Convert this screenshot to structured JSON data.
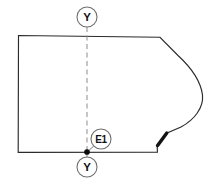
{
  "drawing": {
    "title": "Cross-section outline with section plane Y-Y and detail callout E1",
    "canvas": {
      "width": 214,
      "height": 184,
      "background": "#ffffff"
    },
    "style": {
      "outline_color": "#2b2b2b",
      "outline_width": 1.15,
      "highlight_color": "#131313",
      "highlight_width": 3.4,
      "centerline_color": "#8d8d8d",
      "marker_stroke_color": "#6e6e6e",
      "marker_fill_color": "#ffffff",
      "text_color": "#111111",
      "dot_color": "#0d0d0d"
    },
    "outline": {
      "name": "part-profile",
      "closed": true,
      "path": "M 18.5 35.5 L 160.0 37.3 L 178.0 55.5 C 190.0 66.5 200.5 80.0 202.5 95.0 C 203.8 108.0 194.0 120.0 181.0 127.0 L 166.5 133.2 L 157.2 146.0 L 157.4 152.2 L 18.2 152.4 Z",
      "description": "Left vertical edge slightly tapered, flat top edge, chamfer down-right, convex bulge on the right, concave return and a small step notch at lower right, flat bottom edge"
    },
    "highlight_edge": {
      "name": "emphasized-edge-segment",
      "path": "M 157.6 145.6 L 166.8 133.0",
      "description": "Bold thickened boundary segment at the lower right near detail E1"
    },
    "center_line": {
      "name": "section-center-line",
      "label": "Y-Y",
      "x": 87,
      "y_start": 27,
      "y_end": 157,
      "dash_pattern": "5 3.5"
    },
    "markers": [
      {
        "id": "section-marker-top",
        "label": "Y",
        "cx": 87,
        "cy": 17,
        "r": 10,
        "type": "section-letter"
      },
      {
        "id": "section-marker-bottom",
        "label": "Y",
        "cx": 87,
        "cy": 167,
        "r": 10,
        "type": "section-letter"
      },
      {
        "id": "detail-callout-e1",
        "label": "E1",
        "cx": 101,
        "cy": 139,
        "r": 10,
        "type": "detail-callout"
      }
    ],
    "leader": {
      "name": "detail-leader-line",
      "from_x": 93.5,
      "from_y": 146.2,
      "to_x": 87.3,
      "to_y": 152.0
    },
    "node_point": {
      "name": "center-line-intersection-node",
      "cx": 87,
      "cy": 152,
      "r": 2.6
    }
  }
}
